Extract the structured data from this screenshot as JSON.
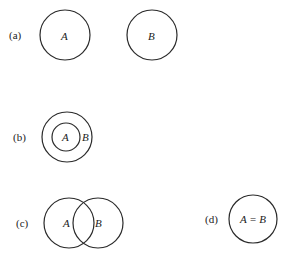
{
  "panels": [
    {
      "id": "a",
      "label": "(a)",
      "sets": [
        "A",
        "B"
      ],
      "relation": "disjoint"
    },
    {
      "id": "b",
      "label": "(b)",
      "sets": [
        "A",
        "B"
      ],
      "relation": "A subset of B"
    },
    {
      "id": "c",
      "label": "(c)",
      "sets": [
        "A",
        "B"
      ],
      "relation": "overlapping"
    },
    {
      "id": "d",
      "label": "(d)",
      "sets": [
        "A = B"
      ],
      "relation": "equal"
    }
  ]
}
